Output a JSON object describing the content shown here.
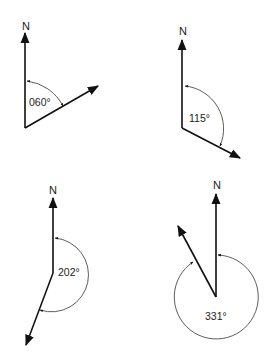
{
  "figure": {
    "north_label": "N",
    "diagrams": [
      {
        "id": "bearing-060",
        "label": "060°",
        "bearing_deg": 60
      },
      {
        "id": "bearing-115",
        "label": "115°",
        "bearing_deg": 115
      },
      {
        "id": "bearing-202",
        "label": "202°",
        "bearing_deg": 202
      },
      {
        "id": "bearing-331",
        "label": "331°",
        "bearing_deg": 331
      }
    ]
  },
  "colors": {
    "line": "#111111",
    "arc": "#333333",
    "text": "#222222"
  }
}
